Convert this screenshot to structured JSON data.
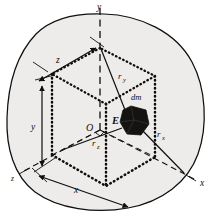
{
  "figure": {
    "kind": "3d-coordinate-mass-element-diagram",
    "background_color": "#ffffff",
    "ink_color": "#100f0d",
    "body_fill_color": "#eeecea",
    "mass_element_fill_color": "#151311"
  },
  "axes": [
    {
      "name": "y-axis",
      "label": "y",
      "style": "dashed",
      "direction": "up"
    },
    {
      "name": "x-axis",
      "label": "x",
      "style": "dashed",
      "direction": "lower-right"
    },
    {
      "name": "z-axis",
      "label": "z",
      "style": "dashed",
      "direction": "lower-left"
    }
  ],
  "points": [
    {
      "name": "origin",
      "label": "O",
      "note": "right-angle tick at origin"
    },
    {
      "name": "element-center",
      "label": "E"
    }
  ],
  "mass_element": {
    "label": "dm",
    "shape": "irregular-hexagonal-blob"
  },
  "radii": [
    {
      "name": "r-x",
      "base": "r",
      "subscript": "x",
      "label": "r_x",
      "from": "x-axis",
      "to": "E"
    },
    {
      "name": "r-y",
      "base": "r",
      "subscript": "y",
      "label": "r_y",
      "from": "y-axis",
      "to": "E"
    },
    {
      "name": "r-z",
      "base": "r",
      "subscript": "z",
      "label": "r_z",
      "from": "z-axis",
      "to": "E"
    }
  ],
  "dimensions": [
    {
      "name": "dim-z",
      "label": "z",
      "location": "top-left",
      "arrow": "double-headed"
    },
    {
      "name": "dim-y",
      "label": "y",
      "location": "left",
      "arrow": "double-headed"
    },
    {
      "name": "dim-x",
      "label": "x",
      "location": "bottom",
      "arrow": "double-headed"
    }
  ],
  "construction": {
    "box_style": "dotted",
    "hidden_edge_style": "dashed",
    "note": "dotted rectangular box whose corner coordinates are x, y, z"
  }
}
